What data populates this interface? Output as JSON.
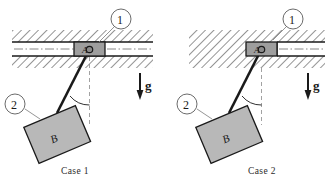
{
  "figure": {
    "type": "mechanics-diagram",
    "background_color": "#ffffff",
    "ink_color": "#1a1a1a",
    "block_fill": "#b8b8b8",
    "block_a_fill": "#9e9e9e",
    "hatch_color": "#2b2b2b"
  },
  "cases": [
    {
      "id": "case1",
      "caption": "Case 1",
      "slot": {
        "open_left": true,
        "open_right": true
      },
      "callouts": [
        {
          "id": "callout-1",
          "label": "1",
          "target": "block-a"
        },
        {
          "id": "callout-2",
          "label": "2",
          "target": "block-b"
        }
      ],
      "block_a_label": "A",
      "block_b_label": "B",
      "angle_label": "θ₀",
      "gravity_label": "g",
      "angle_degrees": 30
    },
    {
      "id": "case2",
      "caption": "Case 2",
      "slot": {
        "open_left": false,
        "open_right": true
      },
      "callouts": [
        {
          "id": "callout-1",
          "label": "1",
          "target": "block-a"
        },
        {
          "id": "callout-2",
          "label": "2",
          "target": "block-b"
        }
      ],
      "block_a_label": "A",
      "block_b_label": "B",
      "angle_label": "θ₀",
      "gravity_label": "g",
      "angle_degrees": 30
    }
  ]
}
